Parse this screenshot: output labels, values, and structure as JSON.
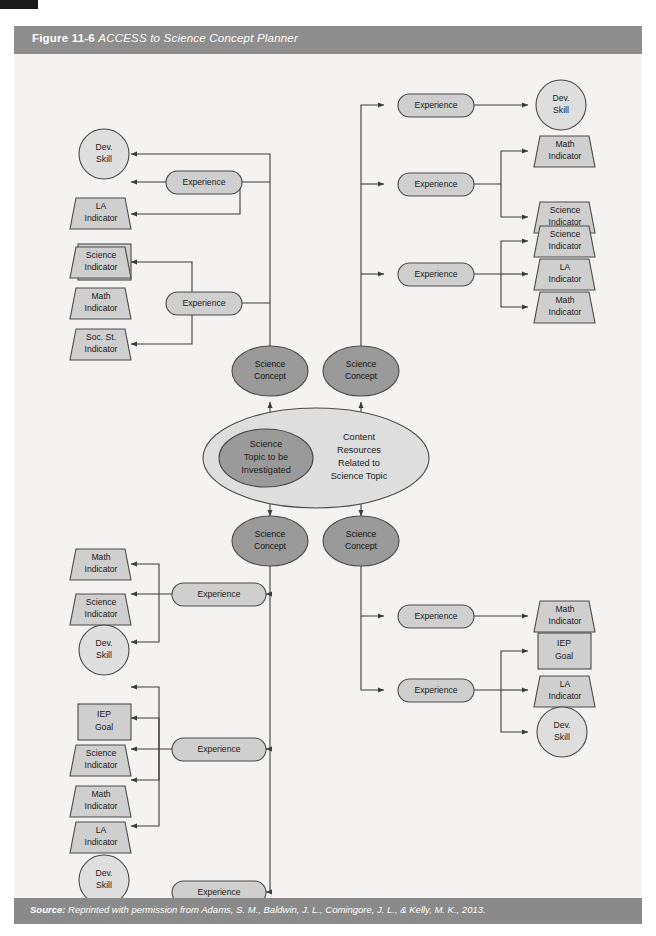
{
  "figure": {
    "number": "Figure 11-6",
    "name": "ACCESS to Science Concept Planner",
    "source_label": "Source:",
    "source_text": " Reprinted with permission from Adams, S. M., Baldwin, J. L., Comingore, J. L., & Kelly, M. K., 2013."
  },
  "colors": {
    "title_bar": "#8e8e8e",
    "source_bar": "#8a8a8a",
    "canvas": "#f4f3f1",
    "shape_light": "#cfcfcf",
    "shape_mid": "#9a9a9a",
    "shape_pale": "#dedede",
    "stroke": "#4a4a4a"
  },
  "center": {
    "outer_ellipse_label_line1": "Content",
    "outer_ellipse_label_line2": "Resources",
    "outer_ellipse_label_line3": "Related to",
    "outer_ellipse_label_line4": "Science Topic",
    "inner_ellipse_label_line1": "Science",
    "inner_ellipse_label_line2": "Topic to be",
    "inner_ellipse_label_line3": "Investigated"
  },
  "concepts": [
    {
      "id": "concept-top-left",
      "line1": "Science",
      "line2": "Concept"
    },
    {
      "id": "concept-top-right",
      "line1": "Science",
      "line2": "Concept"
    },
    {
      "id": "concept-bottom-left",
      "line1": "Science",
      "line2": "Concept"
    },
    {
      "id": "concept-bottom-right",
      "line1": "Science",
      "line2": "Concept"
    }
  ],
  "experiences": [
    {
      "id": "exp-tl-1",
      "label": "Experience"
    },
    {
      "id": "exp-tl-2",
      "label": "Experience"
    },
    {
      "id": "exp-tr-1",
      "label": "Experience"
    },
    {
      "id": "exp-tr-2",
      "label": "Experience"
    },
    {
      "id": "exp-tr-3",
      "label": "Experience"
    },
    {
      "id": "exp-bl-1",
      "label": "Experience"
    },
    {
      "id": "exp-bl-2",
      "label": "Experience"
    },
    {
      "id": "exp-bl-3",
      "label": "Experience"
    },
    {
      "id": "exp-br-1",
      "label": "Experience"
    },
    {
      "id": "exp-br-2",
      "label": "Experience"
    }
  ],
  "outcomes": {
    "top_left_group_a": [
      {
        "id": "tl-dev-skill",
        "shape": "circle",
        "line1": "Dev.",
        "line2": "Skill"
      },
      {
        "id": "tl-la-indicator",
        "shape": "trapezoid",
        "line1": "LA",
        "line2": "Indicator"
      },
      {
        "id": "tl-iep-goal",
        "shape": "rect",
        "line1": "IEP",
        "line2": "Goal"
      }
    ],
    "top_left_group_b": [
      {
        "id": "tl-science-indicator",
        "shape": "trapezoid",
        "line1": "Science",
        "line2": "Indicator"
      },
      {
        "id": "tl-math-indicator",
        "shape": "trapezoid",
        "line1": "Math",
        "line2": "Indicator"
      },
      {
        "id": "tl-socst-indicator",
        "shape": "trapezoid",
        "line1": "Soc. St.",
        "line2": "Indicator"
      }
    ],
    "top_right_group_a": [
      {
        "id": "tr-dev-skill",
        "shape": "circle",
        "line1": "Dev.",
        "line2": "Skill"
      }
    ],
    "top_right_group_b": [
      {
        "id": "tr-math-indicator",
        "shape": "trapezoid",
        "line1": "Math",
        "line2": "Indicator"
      },
      {
        "id": "tr-science-indicator",
        "shape": "trapezoid",
        "line1": "Science",
        "line2": "Indicator"
      }
    ],
    "top_right_group_c": [
      {
        "id": "tr-science-indicator-2",
        "shape": "trapezoid",
        "line1": "Science",
        "line2": "Indicator"
      },
      {
        "id": "tr-la-indicator",
        "shape": "trapezoid",
        "line1": "LA",
        "line2": "Indicator"
      },
      {
        "id": "tr-math-indicator-2",
        "shape": "trapezoid",
        "line1": "Math",
        "line2": "Indicator"
      }
    ],
    "bottom_left_group_a": [
      {
        "id": "bl-math-indicator",
        "shape": "trapezoid",
        "line1": "Math",
        "line2": "Indicator"
      },
      {
        "id": "bl-science-indicator",
        "shape": "trapezoid",
        "line1": "Science",
        "line2": "Indicator"
      },
      {
        "id": "bl-dev-skill",
        "shape": "circle",
        "line1": "Dev.",
        "line2": "Skill"
      }
    ],
    "bottom_left_group_b": [
      {
        "id": "bl-iep-goal",
        "shape": "rect",
        "line1": "IEP",
        "line2": "Goal"
      },
      {
        "id": "bl-science-indicator-2",
        "shape": "trapezoid",
        "line1": "Science",
        "line2": "Indicator"
      },
      {
        "id": "bl-math-indicator-2",
        "shape": "trapezoid",
        "line1": "Math",
        "line2": "Indicator"
      },
      {
        "id": "bl-la-indicator",
        "shape": "trapezoid",
        "line1": "LA",
        "line2": "Indicator"
      },
      {
        "id": "bl-dev-skill-2",
        "shape": "circle",
        "line1": "Dev.",
        "line2": "Skill"
      }
    ],
    "bottom_right_group_a": [
      {
        "id": "br-math-indicator",
        "shape": "trapezoid",
        "line1": "Math",
        "line2": "Indicator"
      }
    ],
    "bottom_right_group_b": [
      {
        "id": "br-iep-goal",
        "shape": "rect",
        "line1": "IEP",
        "line2": "Goal"
      },
      {
        "id": "br-la-indicator",
        "shape": "trapezoid",
        "line1": "LA",
        "line2": "Indicator"
      },
      {
        "id": "br-dev-skill",
        "shape": "circle",
        "line1": "Dev.",
        "line2": "Skill"
      }
    ]
  }
}
